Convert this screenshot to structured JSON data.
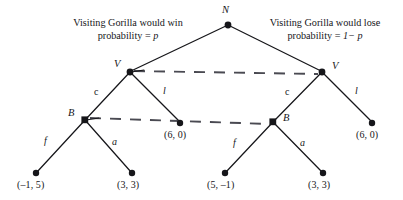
{
  "figure": {
    "type": "extensive-form-game-tree",
    "width": 403,
    "height": 200,
    "background": "#ffffff",
    "line_color": "#16161a",
    "dash_color": "#4a4a52"
  },
  "captions": {
    "left": {
      "line1": "Visiting Gorilla would win",
      "line2_prefix": "probability = ",
      "line2_var": "p"
    },
    "right": {
      "line1": "Visiting Gorilla would lose",
      "line2_prefix": "probability = ",
      "line2_var": "1− p"
    }
  },
  "nodes": {
    "root": {
      "id": "N",
      "x": 228,
      "y": 25,
      "shape": "circle"
    },
    "v_left": {
      "id": "V",
      "x": 130,
      "y": 72,
      "shape": "circle"
    },
    "v_right": {
      "id": "V",
      "x": 322,
      "y": 72,
      "shape": "circle"
    },
    "b_left": {
      "id": "B",
      "x": 85,
      "y": 120,
      "shape": "square"
    },
    "b_right": {
      "id": "B",
      "x": 273,
      "y": 122,
      "shape": "square"
    }
  },
  "actions": {
    "left_c": "c",
    "left_l": "l",
    "right_c": "c",
    "right_l": "l",
    "left_f": "f",
    "left_a": "a",
    "right_f": "f",
    "right_a": "a"
  },
  "terminals": [
    {
      "key": "left_l_payoff",
      "label": "(6, 0)",
      "x": 180,
      "y": 123
    },
    {
      "key": "right_l_payoff",
      "label": "(6, 0)",
      "x": 372,
      "y": 123
    },
    {
      "key": "left_f_payoff",
      "label": "(–1, 5)",
      "x": 36,
      "y": 173
    },
    {
      "key": "left_a_payoff",
      "label": "(3, 3)",
      "x": 132,
      "y": 173
    },
    {
      "key": "right_f_payoff",
      "label": "(5, –1)",
      "x": 225,
      "y": 173
    },
    {
      "key": "right_a_payoff",
      "label": "(3, 3)",
      "x": 323,
      "y": 173
    }
  ],
  "information_sets": [
    {
      "key": "v_info_set",
      "connects": [
        "v_left",
        "v_right"
      ],
      "style": "dashed"
    },
    {
      "key": "b_info_set",
      "connects": [
        "b_left",
        "b_right"
      ],
      "style": "dashed"
    }
  ]
}
